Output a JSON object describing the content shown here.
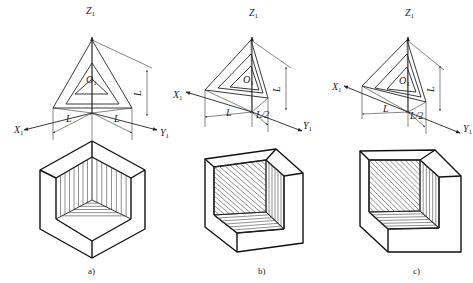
{
  "figure": {
    "colors": {
      "line": "#222222",
      "background": "#ffffff"
    }
  },
  "panels": [
    {
      "id": "a",
      "caption": "a)",
      "axis_labels": {
        "z": "Z",
        "x": "X",
        "y": "Y",
        "origin": "O",
        "subscript": "1"
      },
      "dimension_labels": {
        "left": "L",
        "right": "L",
        "vertical": "L"
      },
      "axes": {
        "origin": [
          92,
          113
        ],
        "z_end": [
          92,
          37
        ],
        "x_end": [
          24,
          130
        ],
        "y_end": [
          157,
          130
        ]
      },
      "triangles": [
        [
          [
            92,
            40
          ],
          [
            53,
            108
          ],
          [
            132,
            108
          ]
        ],
        [
          [
            92,
            63
          ],
          [
            66,
            104
          ],
          [
            119,
            104
          ]
        ],
        [
          [
            92,
            79
          ],
          [
            75,
            94
          ],
          [
            108,
            94
          ]
        ]
      ],
      "dim": {
        "left_ext": [
          [
            53,
            108
          ],
          [
            53,
            140
          ]
        ],
        "right_ext": [
          [
            132,
            108
          ],
          [
            132,
            140
          ]
        ],
        "center_ext": [
          [
            92,
            113
          ],
          [
            92,
            140
          ]
        ],
        "left_arrow": [
          [
            53,
            133
          ],
          [
            92,
            113
          ]
        ],
        "right_arrow": [
          [
            92,
            113
          ],
          [
            132,
            133
          ]
        ],
        "vert_ext_top": [
          [
            92,
            40
          ],
          [
            152,
            68
          ]
        ],
        "vert_line": [
          [
            147,
            70
          ],
          [
            147,
            116
          ]
        ],
        "left_text_pos": [
          66,
          122
        ],
        "right_text_pos": [
          114,
          122
        ],
        "vert_text_pos": [
          141,
          96
        ]
      },
      "label_pos": {
        "z": [
          86,
          14
        ],
        "x": [
          14,
          133
        ],
        "y": [
          160,
          136
        ],
        "origin": [
          86,
          83
        ]
      },
      "block": {
        "outer": [
          [
            92,
            141
          ],
          [
            145,
            170
          ],
          [
            145,
            229
          ],
          [
            92,
            258
          ],
          [
            40,
            229
          ],
          [
            40,
            170
          ]
        ],
        "inner_lines": [
          [
            [
              92,
              141
            ],
            [
              92,
              157
            ]
          ],
          [
            [
              145,
              170
            ],
            [
              131,
              178
            ]
          ],
          [
            [
              40,
              170
            ],
            [
              56,
              178
            ]
          ],
          [
            [
              92,
              258
            ],
            [
              92,
              241
            ]
          ],
          [
            [
              56,
              178
            ],
            [
              56,
              219
            ]
          ],
          [
            [
              56,
              219
            ],
            [
              92,
              241
            ]
          ],
          [
            [
              131,
              178
            ],
            [
              131,
              219
            ]
          ],
          [
            [
              131,
              219
            ],
            [
              92,
              241
            ]
          ],
          [
            [
              56,
              178
            ],
            [
              92,
              157
            ]
          ],
          [
            [
              131,
              178
            ],
            [
              92,
              157
            ]
          ]
        ],
        "cut": {
          "top": [
            92,
            157
          ],
          "left": [
            56,
            219
          ],
          "right": [
            131,
            219
          ],
          "center": [
            92,
            200
          ]
        }
      }
    },
    {
      "id": "b",
      "caption": "b)",
      "axis_labels": {
        "z": "Z",
        "x": "X",
        "y": "Y",
        "origin": "O",
        "subscript": "1"
      },
      "dimension_labels": {
        "left": "L",
        "right": "L/2",
        "vertical": "L"
      },
      "axes": {
        "origin": [
          252,
          112
        ],
        "z_end": [
          252,
          37
        ],
        "x_end": [
          186,
          92
        ],
        "y_end": [
          302,
          131
        ]
      },
      "triangles": [
        [
          [
            251,
            40
          ],
          [
            205,
            90
          ],
          [
            268,
            98
          ]
        ],
        [
          [
            251,
            54
          ],
          [
            218,
            88
          ],
          [
            263,
            93
          ]
        ],
        [
          [
            251,
            66
          ],
          [
            230,
            87
          ],
          [
            259,
            90
          ]
        ]
      ],
      "dim": {
        "left_ext": [
          [
            205,
            90
          ],
          [
            205,
            127
          ]
        ],
        "right_ext": [
          [
            268,
            98
          ],
          [
            268,
            132
          ]
        ],
        "center_ext": [
          [
            252,
            112
          ],
          [
            252,
            127
          ]
        ],
        "left_arrow": [
          [
            205,
            117
          ],
          [
            252,
            112
          ]
        ],
        "right_arrow": [
          [
            252,
            112
          ],
          [
            268,
            125
          ]
        ],
        "vert_ext_top": [
          [
            251,
            40
          ],
          [
            291,
            68
          ]
        ],
        "vert_line": [
          [
            286,
            67
          ],
          [
            286,
            110
          ]
        ],
        "left_text_pos": [
          226,
          116
        ],
        "right_text_pos": [
          256,
          118
        ],
        "vert_text_pos": [
          280,
          92
        ]
      },
      "label_pos": {
        "z": [
          249,
          16
        ],
        "x": [
          173,
          98
        ],
        "y": [
          303,
          129
        ],
        "origin": [
          243,
          83
        ]
      },
      "block": {
        "outer": [
          [
            205,
            159
          ],
          [
            276,
            149
          ],
          [
            303,
            173
          ],
          [
            303,
            243
          ],
          [
            237,
            252
          ],
          [
            205,
            227
          ]
        ],
        "inner_lines": [
          [
            [
              205,
              159
            ],
            [
              214,
              167
            ]
          ],
          [
            [
              276,
              149
            ],
            [
              266,
              160
            ]
          ],
          [
            [
              303,
              173
            ],
            [
              284,
              176
            ]
          ],
          [
            [
              214,
              167
            ],
            [
              266,
              160
            ]
          ],
          [
            [
              266,
              160
            ],
            [
              284,
              176
            ]
          ],
          [
            [
              284,
              176
            ],
            [
              284,
              229
            ]
          ],
          [
            [
              214,
              167
            ],
            [
              214,
              215
            ]
          ],
          [
            [
              214,
              215
            ],
            [
              237,
              233
            ]
          ],
          [
            [
              237,
              233
            ],
            [
              284,
              229
            ]
          ],
          [
            [
              237,
              233
            ],
            [
              237,
              252
            ]
          ]
        ],
        "cut": {
          "tl": [
            214,
            167
          ],
          "tr": [
            266,
            160
          ],
          "br": [
            266,
            212
          ],
          "bl": [
            214,
            215
          ],
          "rt": [
            284,
            176
          ],
          "rb": [
            284,
            229
          ],
          "fb": [
            237,
            233
          ]
        }
      }
    },
    {
      "id": "c",
      "caption": "c)",
      "axis_labels": {
        "z": "Z",
        "x": "X",
        "y": "Y",
        "origin": "O",
        "subscript": "1"
      },
      "dimension_labels": {
        "left": "L",
        "right": "L/2",
        "vertical": "L"
      },
      "axes": {
        "origin": [
          408,
          112
        ],
        "z_end": [
          408,
          37
        ],
        "x_end": [
          344,
          86
        ],
        "y_end": [
          460,
          133
        ]
      },
      "triangles": [
        [
          [
            407,
            40
          ],
          [
            362,
            86
          ],
          [
            426,
            102
          ]
        ],
        [
          [
            407,
            54
          ],
          [
            375,
            88
          ],
          [
            421,
            97
          ]
        ],
        [
          [
            407,
            67
          ],
          [
            387,
            89
          ],
          [
            416,
            92
          ]
        ]
      ],
      "dim": {
        "left_ext": [
          [
            362,
            86
          ],
          [
            362,
            119
          ]
        ],
        "right_ext": [
          [
            426,
            102
          ],
          [
            426,
            134
          ]
        ],
        "center_ext": [
          [
            408,
            112
          ],
          [
            408,
            127
          ]
        ],
        "left_arrow": [
          [
            362,
            114
          ],
          [
            408,
            112
          ]
        ],
        "right_arrow": [
          [
            408,
            112
          ],
          [
            425,
            127
          ]
        ],
        "vert_ext_top": [
          [
            407,
            40
          ],
          [
            444,
            70
          ]
        ],
        "vert_line": [
          [
            440,
            66
          ],
          [
            440,
            111
          ]
        ],
        "left_text_pos": [
          383,
          112
        ],
        "right_text_pos": [
          410,
          119
        ],
        "vert_text_pos": [
          434,
          92
        ]
      },
      "label_pos": {
        "z": [
          405,
          16
        ],
        "x": [
          332,
          90
        ],
        "y": [
          463,
          132
        ],
        "origin": [
          399,
          84
        ]
      },
      "block": {
        "outer": [
          [
            360,
            151
          ],
          [
            435,
            150
          ],
          [
            461,
            176
          ],
          [
            461,
            252
          ],
          [
            388,
            252
          ],
          [
            360,
            226
          ]
        ],
        "inner_lines": [
          [
            [
              360,
              151
            ],
            [
              369,
              160
            ]
          ],
          [
            [
              435,
              150
            ],
            [
              420,
              160
            ]
          ],
          [
            [
              461,
              176
            ],
            [
              439,
              177
            ]
          ],
          [
            [
              369,
              160
            ],
            [
              420,
              160
            ]
          ],
          [
            [
              420,
              160
            ],
            [
              439,
              177
            ]
          ],
          [
            [
              439,
              177
            ],
            [
              439,
              228
            ]
          ],
          [
            [
              369,
              160
            ],
            [
              369,
              212
            ]
          ],
          [
            [
              369,
              212
            ],
            [
              388,
              229
            ]
          ],
          [
            [
              388,
              229
            ],
            [
              439,
              228
            ]
          ],
          [
            [
              388,
              229
            ],
            [
              388,
              252
            ]
          ]
        ],
        "cut": {
          "tl": [
            369,
            160
          ],
          "tr": [
            420,
            160
          ],
          "br": [
            420,
            211
          ],
          "bl": [
            369,
            212
          ],
          "rt": [
            439,
            177
          ],
          "rb": [
            439,
            228
          ],
          "fb": [
            388,
            229
          ]
        }
      }
    }
  ],
  "captions": {
    "a": {
      "text": "a)",
      "pos": [
        88,
        274
      ]
    },
    "b": {
      "text": "b)",
      "pos": [
        258,
        274
      ]
    },
    "c": {
      "text": "c)",
      "pos": [
        413,
        274
      ]
    }
  }
}
